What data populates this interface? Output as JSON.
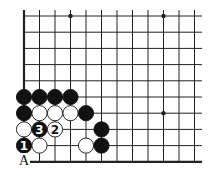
{
  "diagram": {
    "type": "go-board-corner",
    "colors": {
      "line": "#222222",
      "black": "#111111",
      "white": "#ffffff",
      "background": "#ffffff"
    },
    "grid": {
      "x": [
        24,
        39.5,
        55,
        70.5,
        86,
        101.5,
        117,
        132.5,
        148,
        163.5,
        179,
        194.5
      ],
      "y": [
        16,
        32.2,
        48.4,
        64.6,
        80.8,
        97,
        113.2,
        129.4,
        145.6,
        161.8
      ],
      "right_edge": 202
    },
    "star_points": [
      [
        3,
        0
      ],
      [
        9,
        0
      ],
      [
        9,
        6
      ]
    ],
    "stones": [
      {
        "col": 0,
        "row": 5,
        "color": "black"
      },
      {
        "col": 1,
        "row": 5,
        "color": "black"
      },
      {
        "col": 2,
        "row": 5,
        "color": "black"
      },
      {
        "col": 3,
        "row": 5,
        "color": "black"
      },
      {
        "col": 0,
        "row": 6,
        "color": "black"
      },
      {
        "col": 1,
        "row": 6,
        "color": "white"
      },
      {
        "col": 2,
        "row": 6,
        "color": "white"
      },
      {
        "col": 3,
        "row": 6,
        "color": "white"
      },
      {
        "col": 4,
        "row": 6,
        "color": "black"
      },
      {
        "col": 0,
        "row": 7,
        "color": "white"
      },
      {
        "col": 1,
        "row": 7,
        "color": "black",
        "label": "3"
      },
      {
        "col": 2,
        "row": 7,
        "color": "white",
        "label": "2"
      },
      {
        "col": 5,
        "row": 7,
        "color": "black"
      },
      {
        "col": 0,
        "row": 8,
        "color": "black",
        "label": "1"
      },
      {
        "col": 1,
        "row": 8,
        "color": "white"
      },
      {
        "col": 4,
        "row": 8,
        "color": "white"
      },
      {
        "col": 5,
        "row": 8,
        "color": "black"
      }
    ],
    "point_labels": [
      {
        "text": "A",
        "col": 0,
        "row": 9
      }
    ]
  }
}
